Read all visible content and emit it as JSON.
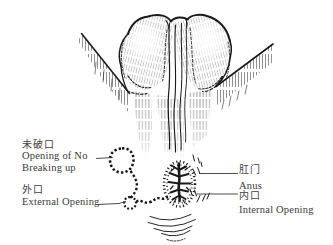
{
  "illustration": {
    "subject": "anal-fistula-buttocks-line-drawing",
    "ink_color": "#1a1a1a",
    "text_color": "#3a3a3a",
    "paper_color": "#ffffff"
  },
  "labels": {
    "unruptured_opening": {
      "zh": "未破口",
      "en_line1": "Opening of No",
      "en_line2": "Breaking up"
    },
    "external_opening": {
      "zh": "外口",
      "en": "External Opening"
    },
    "anus": {
      "zh": "肛门",
      "en": "Anus"
    },
    "internal_opening": {
      "zh": "内口",
      "en": "Internal Opening"
    }
  }
}
